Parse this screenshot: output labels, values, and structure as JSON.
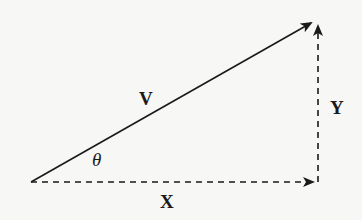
{
  "diagram": {
    "type": "vector-decomposition",
    "background": "#f7f7f5",
    "stroke_color": "#1a1a1a",
    "origin": [
      31,
      182
    ],
    "vectors": [
      {
        "id": "V",
        "label": "V",
        "style": "solid",
        "from": [
          31,
          182
        ],
        "to": [
          313,
          22
        ]
      },
      {
        "id": "X",
        "label": "X",
        "style": "dashed",
        "from": [
          31,
          182
        ],
        "to": [
          315,
          182
        ]
      },
      {
        "id": "Y",
        "label": "Y",
        "style": "dashed",
        "from": [
          318,
          182
        ],
        "to": [
          318,
          24
        ]
      }
    ],
    "labels": {
      "v": "V",
      "x": "X",
      "y": "Y",
      "angle": "θ"
    }
  }
}
